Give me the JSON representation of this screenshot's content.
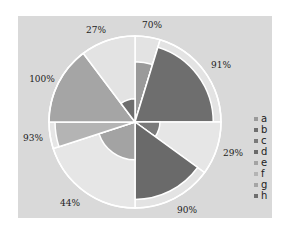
{
  "chart_data": {
    "type": "polar-area",
    "title": "",
    "center": [
      135,
      122
    ],
    "outer_radius": 86,
    "background_color": "#d9d9d9",
    "sectors": [
      {
        "name": "a",
        "start": 0,
        "end": 17,
        "value": 70,
        "label": "70%",
        "color": "#9a9a9a",
        "bg": "#e3e3e3",
        "label_pos": [
          152,
          28
        ]
      },
      {
        "name": "b",
        "start": 17,
        "end": 90,
        "value": 91,
        "label": "91%",
        "color": "#6e6e6e",
        "bg": "#e3e3e3",
        "label_pos": [
          221,
          68
        ]
      },
      {
        "name": "c",
        "start": 90,
        "end": 126,
        "value": 29,
        "label": "29%",
        "color": "#7a7a7a",
        "bg": "#e6e6e6",
        "label_pos": [
          233,
          156
        ]
      },
      {
        "name": "d",
        "start": 126,
        "end": 180,
        "value": 90,
        "label": "90%",
        "color": "#6a6a6a",
        "bg": "#e3e3e3",
        "label_pos": [
          187,
          213
        ]
      },
      {
        "name": "e",
        "start": 180,
        "end": 252,
        "value": 44,
        "label": "44%",
        "color": "#a3a3a3",
        "bg": "#e6e6e6",
        "label_pos": [
          70,
          206
        ]
      },
      {
        "name": "f",
        "start": 252,
        "end": 270,
        "value": 93,
        "label": "93%",
        "color": "#b4b4b4",
        "bg": "#e6e6e6",
        "label_pos": [
          33,
          141
        ]
      },
      {
        "name": "g",
        "start": 270,
        "end": 323,
        "value": 100,
        "label": "100%",
        "color": "#a5a5a5",
        "bg": "#e6e6e6",
        "label_pos": [
          42,
          82
        ]
      },
      {
        "name": "h",
        "start": 323,
        "end": 360,
        "value": 27,
        "label": "27%",
        "color": "#6e6e6e",
        "bg": "#e3e3e3",
        "label_pos": [
          96,
          33
        ]
      }
    ],
    "legend": [
      "a",
      "b",
      "c",
      "d",
      "e",
      "f",
      "g",
      "h"
    ],
    "legend_position": "right"
  }
}
